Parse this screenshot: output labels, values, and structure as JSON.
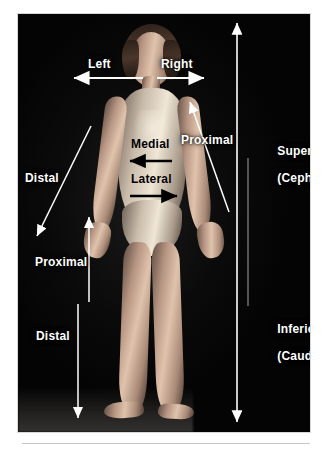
{
  "figure": {
    "panel": {
      "background_color": "#050505",
      "page_background_color": "#ffffff",
      "rule_color": "#c9c9c9"
    }
  },
  "labels": {
    "left": {
      "text": "Left",
      "color": "#ffffff",
      "arrow": "horizontal-left",
      "region": "top-left-of-head"
    },
    "right": {
      "text": "Right",
      "color": "#ffffff",
      "arrow": "horizontal-right",
      "region": "top-right-of-head"
    },
    "medial": {
      "text": "Medial",
      "color": "#000000",
      "arrow": "horizontal-left",
      "region": "upper-torso"
    },
    "lateral": {
      "text": "Lateral",
      "color": "#000000",
      "arrow": "horizontal-right",
      "region": "lower-torso"
    },
    "distal_arm": {
      "text": "Distal",
      "color": "#ffffff",
      "arrow": "diagonal-down-left",
      "region": "left-arm"
    },
    "proximal_arm": {
      "text": "Proximal",
      "color": "#ffffff",
      "arrow": "diagonal-up",
      "region": "right-arm"
    },
    "proximal_leg": {
      "text": "Proximal",
      "color": "#ffffff",
      "arrow": "vertical-up",
      "region": "left-leg"
    },
    "distal_leg": {
      "text": "Distal",
      "color": "#ffffff",
      "arrow": "vertical-down",
      "region": "left-leg"
    },
    "superior": {
      "line1": "Superior",
      "line2": "(Cephalic)",
      "color": "#ffffff",
      "region": "right-margin-upper"
    },
    "inferior": {
      "line1": "Inferior",
      "line2": "(Caudal)",
      "color": "#ffffff",
      "region": "right-margin-lower"
    }
  },
  "arrows": {
    "axis_vertical": {
      "name": "superior-inferior-axis",
      "style": "double-headed",
      "color": "#ffffff"
    },
    "divider": {
      "name": "superior-inferior-divider",
      "style": "plain-line",
      "color": "#8a8a8a"
    }
  }
}
